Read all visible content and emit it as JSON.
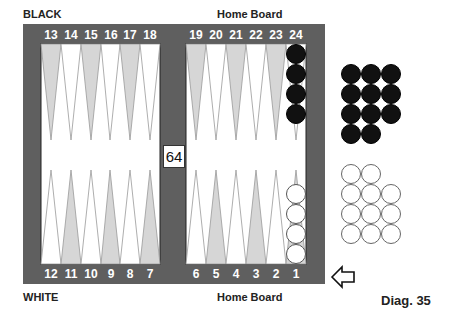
{
  "labels": {
    "top_left": "BLACK",
    "top_right": "Home Board",
    "bottom_left": "WHITE",
    "bottom_right": "Home Board",
    "caption": "Diag. 35"
  },
  "board": {
    "frame_color": "#5f5f5f",
    "dark_point_color": "#d6d6d6",
    "light_point_color": "#ffffff",
    "top_points": [
      "13",
      "14",
      "15",
      "16",
      "17",
      "18",
      "19",
      "20",
      "21",
      "22",
      "23",
      "24"
    ],
    "bottom_points": [
      "12",
      "11",
      "10",
      "9",
      "8",
      "7",
      "6",
      "5",
      "4",
      "3",
      "2",
      "1"
    ],
    "bar_pip_count": "64",
    "checkers": [
      {
        "point": "24",
        "color": "black",
        "count": 4
      },
      {
        "point": "1",
        "color": "white",
        "count": 4
      }
    ]
  },
  "borne_off": {
    "black": {
      "count": 11,
      "rows": [
        3,
        3,
        3,
        2
      ]
    },
    "white": {
      "count": 11,
      "rows": [
        2,
        3,
        3,
        3
      ]
    }
  },
  "indicator": {
    "icon": "left-arrow-icon",
    "position": "beside point 1"
  }
}
